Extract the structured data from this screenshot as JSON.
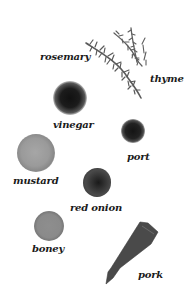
{
  "ingredients": [
    {
      "id": "rosemary",
      "label": "rosemary"
    },
    {
      "id": "thyme",
      "label": "thyme"
    },
    {
      "id": "vinegar",
      "label": "vinegar"
    },
    {
      "id": "port",
      "label": "port"
    },
    {
      "id": "mustard",
      "label": "mustard"
    },
    {
      "id": "red_onion",
      "label": "red onion"
    },
    {
      "id": "honey",
      "label": "boney"
    },
    {
      "id": "pork",
      "label": "pork"
    }
  ],
  "colors": {
    "background": "#ffffff",
    "label_text": "#1a1a1a",
    "herb": "#5a5a5a",
    "vinegar_rim": "#bdbdbd",
    "vinegar_center": "#151515",
    "port_rim": "#a8a8a8",
    "port_center": "#1e1e1e",
    "mustard": "#9a9a9a",
    "red_onion": "#3c3c3c",
    "honey": "#8c8c8c",
    "pork": "#4a4a4a"
  }
}
